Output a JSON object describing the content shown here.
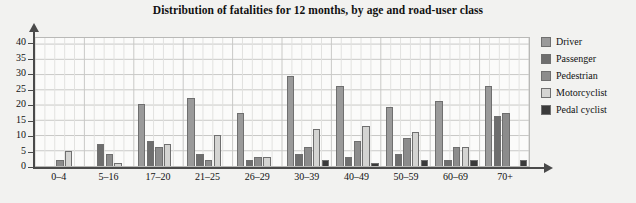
{
  "chart_data": {
    "type": "bar",
    "title": "Distribution of fatalities for 12 months, by age and road-user class",
    "xlabel": "",
    "ylabel": "",
    "ylim": [
      0,
      42
    ],
    "yticks": [
      0,
      5,
      10,
      15,
      20,
      25,
      30,
      35,
      40
    ],
    "grid": true,
    "legend_position": "right",
    "categories": [
      "0–4",
      "5–16",
      "17–20",
      "21–25",
      "26–29",
      "30–39",
      "40–49",
      "50–59",
      "60–69",
      "70+"
    ],
    "series": [
      {
        "name": "Driver",
        "color": "#9a9a9a",
        "values": [
          0,
          0,
          20,
          22,
          17,
          29,
          26,
          19,
          21,
          26
        ]
      },
      {
        "name": "Passenger",
        "color": "#6e6e6e",
        "values": [
          0,
          7,
          8,
          4,
          2,
          4,
          3,
          4,
          2,
          16
        ]
      },
      {
        "name": "Pedestrian",
        "color": "#8c8c8c",
        "values": [
          2,
          4,
          6,
          2,
          3,
          6,
          8,
          9,
          6,
          17
        ]
      },
      {
        "name": "Motorcyclist",
        "color": "#d4d4d2",
        "values": [
          5,
          1,
          7,
          10,
          3,
          12,
          13,
          11,
          6,
          0
        ]
      },
      {
        "name": "Pedal cyclist",
        "color": "#3a3a3a",
        "values": [
          0,
          0,
          0,
          0,
          0,
          2,
          1,
          2,
          2,
          2
        ]
      }
    ]
  },
  "legend": {
    "items": [
      {
        "label": "Driver"
      },
      {
        "label": "Passenger"
      },
      {
        "label": "Pedestrian"
      },
      {
        "label": "Motorcyclist"
      },
      {
        "label": "Pedal cyclist"
      }
    ]
  }
}
